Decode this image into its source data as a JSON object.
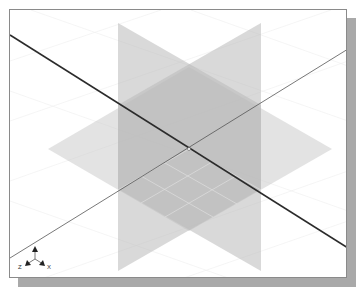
{
  "viewport": {
    "view": "isometric",
    "background": "#ffffff",
    "frame_color": "#8a8a8a",
    "shadow_color": "#a9a9a9"
  },
  "planes": [
    {
      "name": "front-plane",
      "color": "#bdbdbd",
      "opacity": 0.55
    },
    {
      "name": "right-plane",
      "color": "#bdbdbd",
      "opacity": 0.55
    },
    {
      "name": "top-plane",
      "color": "#c8c8c8",
      "opacity": 0.5
    }
  ],
  "axes_lines": {
    "primary_color": "#2b2b2b",
    "secondary_color": "#555555"
  },
  "triad": {
    "labels": {
      "z": "Z",
      "x": "X"
    }
  }
}
